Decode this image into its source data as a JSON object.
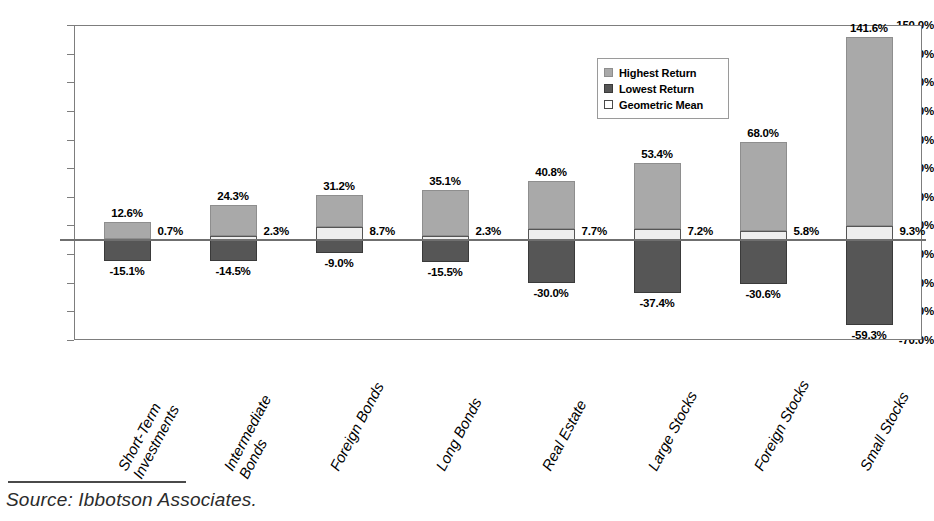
{
  "chart_data": {
    "type": "bar",
    "title": "",
    "xlabel": "",
    "ylabel": "",
    "ylim": [
      -70,
      150
    ],
    "ytick_step": 20,
    "grid": false,
    "legend_position": "top-right",
    "stacked_about_zero": true,
    "categories": [
      "Short-Term Investments",
      "Intermediate Bonds",
      "Foreign Bonds",
      "Long Bonds",
      "Real Estate",
      "Large Stocks",
      "Foreign Stocks",
      "Small Stocks"
    ],
    "category_lines": [
      [
        "Short-Term",
        "Investments"
      ],
      [
        "Intermediate",
        "Bonds"
      ],
      [
        "Foreign Bonds"
      ],
      [
        "Long Bonds"
      ],
      [
        "Real Estate"
      ],
      [
        "Large Stocks"
      ],
      [
        "Foreign Stocks"
      ],
      [
        "Small Stocks"
      ]
    ],
    "ytick_labels": [
      "150.0%",
      "130.0%",
      "110.0%",
      "90.0%",
      "70.0%",
      "50.0%",
      "30.0%",
      "10.0%",
      "-10.0%",
      "-30.0%",
      "-50.0%",
      "-70.0%"
    ],
    "ytick_values": [
      150,
      130,
      110,
      90,
      70,
      50,
      30,
      10,
      -10,
      -30,
      -50,
      -70
    ],
    "series": [
      {
        "name": "Highest Return",
        "color": "#a9a9a9",
        "values": [
          12.6,
          24.3,
          31.2,
          35.1,
          40.8,
          53.4,
          68.0,
          141.6
        ],
        "labels": [
          "12.6%",
          "24.3%",
          "31.2%",
          "35.1%",
          "40.8%",
          "53.4%",
          "68.0%",
          "141.6%"
        ]
      },
      {
        "name": "Lowest Return",
        "color": "#565656",
        "values": [
          -15.1,
          -14.5,
          -9.0,
          -15.5,
          -30.0,
          -37.4,
          -30.6,
          -59.3
        ],
        "labels": [
          "-15.1%",
          "-14.5%",
          "-9.0%",
          "-15.5%",
          "-30.0%",
          "-37.4%",
          "-30.6%",
          "-59.3%"
        ]
      },
      {
        "name": "Geometric Mean",
        "color": "#eeeeee",
        "values": [
          0.7,
          2.3,
          8.7,
          2.3,
          7.7,
          7.2,
          5.8,
          9.3
        ],
        "labels": [
          "0.7%",
          "2.3%",
          "8.7%",
          "2.3%",
          "7.7%",
          "7.2%",
          "5.8%",
          "9.3%"
        ]
      }
    ]
  },
  "legend": {
    "items": [
      {
        "label": "Highest Return",
        "swatch": "high"
      },
      {
        "label": "Lowest Return",
        "swatch": "low"
      },
      {
        "label": "Geometric Mean",
        "swatch": "mean"
      }
    ]
  },
  "source": {
    "text": "Source:  Ibbotson Associates."
  },
  "colors": {
    "highest": "#a9a9a9",
    "lowest": "#565656",
    "mean": "#eeeeee",
    "axis": "#7d7d7d",
    "zero_line": "#6f6f6f"
  }
}
